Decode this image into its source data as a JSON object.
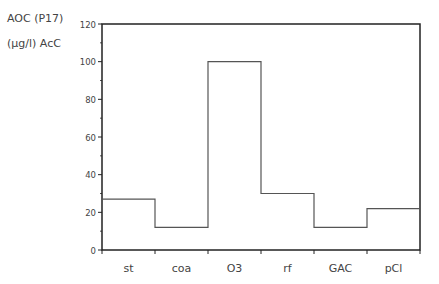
{
  "chart_data": {
    "type": "bar",
    "style": "step",
    "title": "",
    "ylabel_line1": "AOC (P17)",
    "ylabel_line2": "(µg/l) AcC",
    "xlabel": "",
    "categories": [
      "st",
      "coa",
      "O3",
      "rf",
      "GAC",
      "pCl"
    ],
    "values": [
      27,
      12,
      100,
      30,
      12,
      22
    ],
    "ylim": [
      0,
      120
    ],
    "yticks": [
      0,
      20,
      40,
      60,
      80,
      100,
      120
    ],
    "grid": false,
    "legend": null
  },
  "colors": {
    "axis": "#222222",
    "line": "#555555",
    "text": "#444444"
  }
}
